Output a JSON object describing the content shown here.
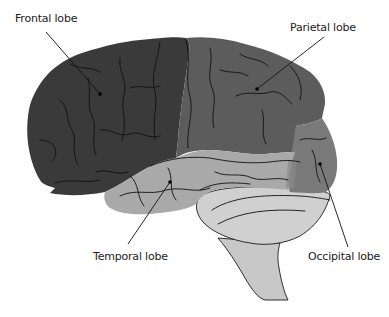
{
  "diagram": {
    "labels": [
      {
        "id": "frontal",
        "text": "Frontal lobe",
        "x": 15,
        "y": 12
      },
      {
        "id": "parietal",
        "text": "Parietal lobe",
        "x": 290,
        "y": 21
      },
      {
        "id": "temporal",
        "text": "Temporal lobe",
        "x": 93,
        "y": 250
      },
      {
        "id": "occipital",
        "text": "Occipital lobe",
        "x": 308,
        "y": 250
      }
    ],
    "regions": [
      {
        "id": "frontal",
        "name": "Frontal lobe",
        "color": "#3a3a3a"
      },
      {
        "id": "parietal",
        "name": "Parietal lobe",
        "color": "#5c5c5c"
      },
      {
        "id": "temporal",
        "name": "Temporal lobe",
        "color": "#a8a8a8"
      },
      {
        "id": "occipital",
        "name": "Occipital lobe",
        "color": "#7a7a7a"
      },
      {
        "id": "cerebellum",
        "name": "Cerebellum",
        "color": "#cfcfcf"
      },
      {
        "id": "brainstem",
        "name": "Brainstem",
        "color": "#c8c8c8"
      }
    ]
  }
}
